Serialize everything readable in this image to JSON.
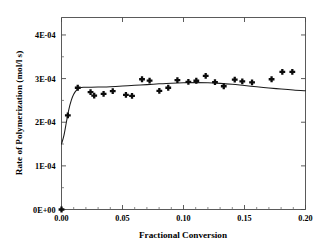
{
  "chart_data": {
    "type": "scatter",
    "title": "",
    "xlabel": "Fractional Conversion",
    "ylabel": "Rate of Polymerization (mol/l s)",
    "xlim": [
      0.0,
      0.2
    ],
    "ylim": [
      0.0,
      0.00044
    ],
    "grid": false,
    "legend": null,
    "x_ticks": [
      0.0,
      0.05,
      0.1,
      0.15,
      0.2
    ],
    "x_tick_labels": [
      "0.00",
      "0.05",
      "0.10",
      "0.15",
      "0.20"
    ],
    "y_ticks": [
      0.0,
      0.0001,
      0.0002,
      0.0003,
      0.0004
    ],
    "y_tick_labels": [
      "0E+00",
      "1E-04",
      "2E-04",
      "3E-04",
      "4E-04"
    ],
    "x_minor_tick_count": 5,
    "y_minor_tick_count": 2,
    "marker_style": "filled-plus",
    "series": [
      {
        "name": "Experimental data",
        "type": "scatter",
        "points": [
          [
            0.0052,
            0.0002155
          ],
          [
            0.0133,
            0.000279
          ],
          [
            0.0238,
            0.000269
          ],
          [
            0.0268,
            0.000261
          ],
          [
            0.0345,
            0.000265
          ],
          [
            0.042,
            0.0002715
          ],
          [
            0.0528,
            0.0002625
          ],
          [
            0.0578,
            0.0002605
          ],
          [
            0.066,
            0.0002985
          ],
          [
            0.0722,
            0.0002955
          ],
          [
            0.0802,
            0.000272
          ],
          [
            0.0875,
            0.000279
          ],
          [
            0.095,
            0.0002965
          ],
          [
            0.104,
            0.0002925
          ],
          [
            0.1105,
            0.000295
          ],
          [
            0.1182,
            0.000306
          ],
          [
            0.1258,
            0.000292
          ],
          [
            0.133,
            0.0002825
          ],
          [
            0.142,
            0.0002975
          ],
          [
            0.1482,
            0.0002935
          ],
          [
            0.1562,
            0.0002915
          ],
          [
            0.1722,
            0.0002985
          ],
          [
            0.181,
            0.0003155
          ],
          [
            0.1892,
            0.0003155
          ]
        ]
      },
      {
        "name": "Model fit",
        "type": "line",
        "points": [
          [
            0.0,
            0.00015
          ],
          [
            0.002,
            0.00017
          ],
          [
            0.004,
            0.0002
          ],
          [
            0.006,
            0.000229
          ],
          [
            0.008,
            0.00025
          ],
          [
            0.01,
            0.000264
          ],
          [
            0.0125,
            0.000274
          ],
          [
            0.015,
            0.0002785
          ],
          [
            0.018,
            0.00028
          ],
          [
            0.022,
            0.0002802
          ],
          [
            0.03,
            0.0002805
          ],
          [
            0.04,
            0.0002815
          ],
          [
            0.05,
            0.0002828
          ],
          [
            0.06,
            0.0002845
          ],
          [
            0.07,
            0.0002862
          ],
          [
            0.08,
            0.000288
          ],
          [
            0.09,
            0.0002895
          ],
          [
            0.1,
            0.0002905
          ],
          [
            0.11,
            0.0002908
          ],
          [
            0.12,
            0.0002905
          ],
          [
            0.13,
            0.000289
          ],
          [
            0.14,
            0.0002868
          ],
          [
            0.15,
            0.000284
          ],
          [
            0.16,
            0.0002812
          ],
          [
            0.17,
            0.0002785
          ],
          [
            0.18,
            0.000276
          ],
          [
            0.19,
            0.0002738
          ],
          [
            0.2,
            0.0002722
          ]
        ]
      }
    ]
  }
}
